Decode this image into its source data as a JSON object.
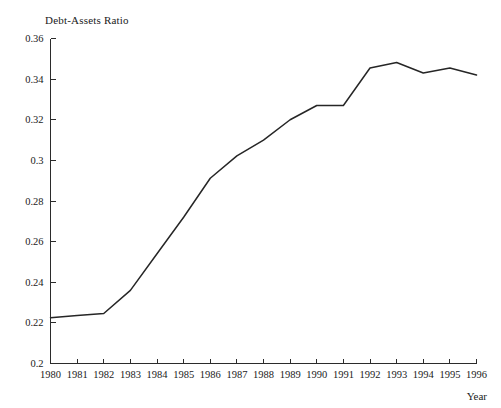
{
  "chart_data": {
    "type": "line",
    "title": "Debt-Assets Ratio",
    "xlabel": "Year",
    "ylabel": "",
    "grid": false,
    "legend": "none",
    "xlim": [
      1980,
      1996
    ],
    "ylim": [
      0.2,
      0.36
    ],
    "x": [
      1980,
      1981,
      1982,
      1983,
      1984,
      1985,
      1986,
      1987,
      1988,
      1989,
      1990,
      1991,
      1992,
      1993,
      1994,
      1995,
      1996
    ],
    "xticklabels": [
      "1980",
      "1981",
      "1982",
      "1983",
      "1984",
      "1985",
      "1986",
      "1987",
      "1988",
      "1989",
      "1990",
      "1991",
      "1992",
      "1993",
      "1994",
      "1995",
      "1996"
    ],
    "yticks": [
      0.2,
      0.22,
      0.24,
      0.26,
      0.28,
      0.3,
      0.32,
      0.34,
      0.36
    ],
    "yticklabels": [
      "0.2",
      "0.22",
      "0.24",
      "0.26",
      "0.28",
      "0.3",
      "0.32",
      "0.34",
      "0.36"
    ],
    "series": [
      {
        "name": "Debt-Assets Ratio",
        "color": "#262626",
        "values": [
          0.2225,
          0.2236,
          0.2246,
          0.236,
          0.254,
          0.272,
          0.2912,
          0.3022,
          0.31,
          0.32,
          0.327,
          0.327,
          0.3455,
          0.3482,
          0.343,
          0.3455,
          0.342
        ]
      }
    ]
  },
  "axis_title": {
    "x": "Year"
  }
}
